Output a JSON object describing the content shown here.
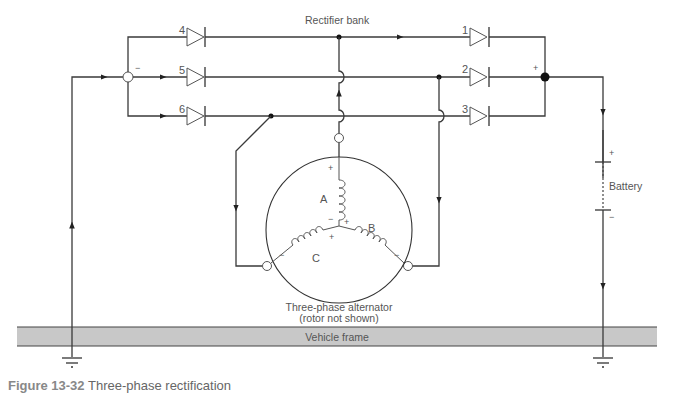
{
  "labels": {
    "rectifier_bank": "Rectifier bank",
    "battery": "Battery",
    "alternator_line1": "Three-phase alternator",
    "alternator_line2": "(rotor not shown)",
    "vehicle_frame": "Vehicle frame",
    "caption_figure": "Figure 13-32",
    "caption_text": "Three-phase rectification"
  },
  "diodes": {
    "d1": "1",
    "d2": "2",
    "d3": "3",
    "d4": "4",
    "d5": "5",
    "d6": "6"
  },
  "windings": {
    "a": "A",
    "b": "B",
    "c": "C"
  },
  "polarity": {
    "plus": "+",
    "minus": "−"
  },
  "colors": {
    "wire": "#3a3a3a",
    "frame_fill": "#c8c8c8",
    "frame_border": "#444444",
    "text": "#555555"
  }
}
